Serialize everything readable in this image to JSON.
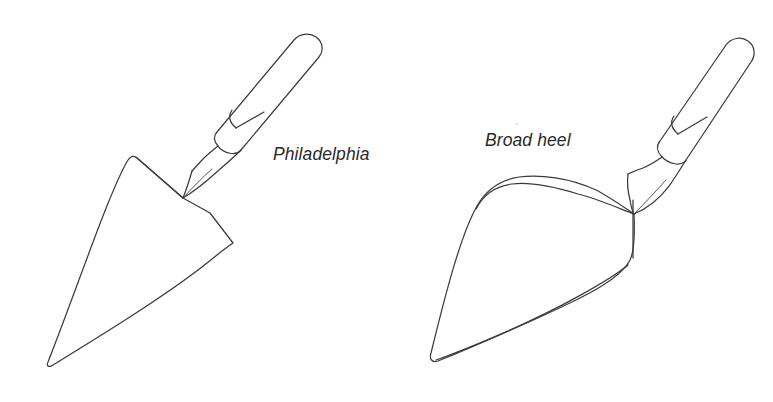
{
  "figure": {
    "background_color": "#ffffff",
    "line_color": "#3b3b3b",
    "caption_color": "#2a2a2a",
    "items": [
      {
        "id": "philadelphia",
        "label": "Philadelphia",
        "label_style": "italic",
        "blade_shape": "pointed teardrop with angular heel",
        "parts": [
          "handle",
          "ferrule",
          "shank",
          "blade"
        ]
      },
      {
        "id": "broad-heel",
        "label": "Broad heel",
        "label_style": "italic",
        "blade_shape": "elongated narrow triangle with rounded broad heel",
        "parts": [
          "handle",
          "ferrule",
          "shank",
          "blade"
        ]
      }
    ]
  },
  "labels": {
    "left": "Philadelphia",
    "right": "Broad heel"
  }
}
